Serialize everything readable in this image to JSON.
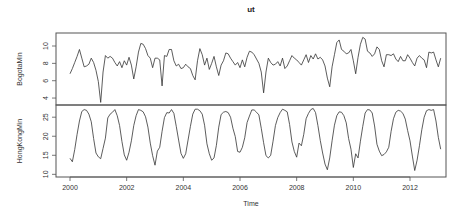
{
  "chart_data": {
    "type": "line",
    "title": "ut",
    "xlabel": "Time",
    "x_start": 2000.0,
    "x_step": 0.0833333,
    "x_ticks": [
      2000,
      2002,
      2004,
      2006,
      2008,
      2010,
      2012
    ],
    "x_tick_labels": [
      "2000",
      "2002",
      "2004",
      "2006",
      "2008",
      "2010",
      "2012"
    ],
    "xlim": [
      1999.5,
      2013.5
    ],
    "panels": [
      {
        "name": "BogotaMin",
        "ylabel": "BogotaMin",
        "ylim": [
          3.2,
          11.5
        ],
        "y_ticks": [
          4,
          6,
          8,
          10
        ],
        "y_tick_labels": [
          "4",
          "6",
          "8",
          "10"
        ],
        "values": [
          6.8,
          7.4,
          8.1,
          8.8,
          9.6,
          8.6,
          7.6,
          7.7,
          7.9,
          8.6,
          8.1,
          7.2,
          5.9,
          3.5,
          7.0,
          8.9,
          8.6,
          8.8,
          8.6,
          8.1,
          7.7,
          8.2,
          7.5,
          8.3,
          7.8,
          8.7,
          7.8,
          6.2,
          7.6,
          9.3,
          10.3,
          10.2,
          9.7,
          8.9,
          8.6,
          7.5,
          8.6,
          8.6,
          8.4,
          5.4,
          8.9,
          8.8,
          9.6,
          9.6,
          8.3,
          7.7,
          7.9,
          7.4,
          7.5,
          7.9,
          7.6,
          7.4,
          6.6,
          6.1,
          8.3,
          9.7,
          9.0,
          7.8,
          8.6,
          7.3,
          8.0,
          8.8,
          7.6,
          6.6,
          7.8,
          8.3,
          9.2,
          9.1,
          8.6,
          8.2,
          7.8,
          8.1,
          7.5,
          8.4,
          7.6,
          8.7,
          9.4,
          9.3,
          9.0,
          8.5,
          8.0,
          7.0,
          4.6,
          7.0,
          8.6,
          8.1,
          7.8,
          7.9,
          8.2,
          7.7,
          8.6,
          7.4,
          7.7,
          8.3,
          8.9,
          8.6,
          8.4,
          8.1,
          7.8,
          8.4,
          9.0,
          8.1,
          8.9,
          8.5,
          9.1,
          8.5,
          8.7,
          8.4,
          7.7,
          6.3,
          5.3,
          7.6,
          9.0,
          10.4,
          10.7,
          9.6,
          9.4,
          9.1,
          9.2,
          9.6,
          8.3,
          6.8,
          8.7,
          10.2,
          11.0,
          10.8,
          9.4,
          9.2,
          8.8,
          9.1,
          9.9,
          9.6,
          8.3,
          7.6,
          9.0,
          9.0,
          8.9,
          9.1,
          8.5,
          8.2,
          8.8,
          8.3,
          8.3,
          9.0,
          8.6,
          8.1,
          7.7,
          8.6,
          8.9,
          8.6,
          8.4,
          7.5,
          9.3,
          9.2,
          9.3,
          8.4,
          7.6,
          8.6
        ]
      },
      {
        "name": "HongKongMin",
        "ylabel": "HongKongMin",
        "ylim": [
          9.3,
          28.2
        ],
        "y_ticks": [
          10,
          15,
          20,
          25
        ],
        "y_tick_labels": [
          "10",
          "15",
          "20",
          "25"
        ],
        "values": [
          14.2,
          13.3,
          16.5,
          20.5,
          24.0,
          26.5,
          27.0,
          26.8,
          25.8,
          23.8,
          19.4,
          15.6,
          14.6,
          14.1,
          16.8,
          19.5,
          24.8,
          25.8,
          26.3,
          27.0,
          25.4,
          22.8,
          18.6,
          15.1,
          13.7,
          15.8,
          18.8,
          22.8,
          25.4,
          27.0,
          26.8,
          26.4,
          25.1,
          22.4,
          18.2,
          14.9,
          12.4,
          16.1,
          17.1,
          21.3,
          24.9,
          26.2,
          26.1,
          27.0,
          26.0,
          22.6,
          19.0,
          15.5,
          14.2,
          15.4,
          19.0,
          22.6,
          25.8,
          27.1,
          27.1,
          26.7,
          25.8,
          22.9,
          18.0,
          15.4,
          13.7,
          14.3,
          17.6,
          22.4,
          25.7,
          26.3,
          26.5,
          26.2,
          25.0,
          22.1,
          19.9,
          16.0,
          15.8,
          17.1,
          19.6,
          23.6,
          25.3,
          26.9,
          26.9,
          26.3,
          25.6,
          22.1,
          18.3,
          14.9,
          14.3,
          15.0,
          18.7,
          22.8,
          24.9,
          26.2,
          27.1,
          26.8,
          26.4,
          23.1,
          18.5,
          16.0,
          14.5,
          18.2,
          17.5,
          20.5,
          24.6,
          26.0,
          27.0,
          27.3,
          26.2,
          22.8,
          18.9,
          15.6,
          12.7,
          11.2,
          14.3,
          18.8,
          22.9,
          25.4,
          26.4,
          26.3,
          25.4,
          23.5,
          19.4,
          16.6,
          11.8,
          15.4,
          14.3,
          18.7,
          22.6,
          26.1,
          27.0,
          26.9,
          26.1,
          22.7,
          17.9,
          16.1,
          14.9,
          15.2,
          15.9,
          17.1,
          21.3,
          24.6,
          26.3,
          26.8,
          26.6,
          26.0,
          24.5,
          21.5,
          18.8,
          14.8,
          11.0,
          13.7,
          17.5,
          21.7,
          25.0,
          26.7,
          27.0,
          26.8,
          27.0,
          24.0,
          19.7,
          16.6
        ]
      }
    ],
    "grid": false,
    "legend": null
  },
  "layout_px": {
    "plot_left": 56,
    "plot_right": 446,
    "panels": [
      {
        "top": 33,
        "bottom": 105
      },
      {
        "top": 105,
        "bottom": 177
      }
    ]
  }
}
